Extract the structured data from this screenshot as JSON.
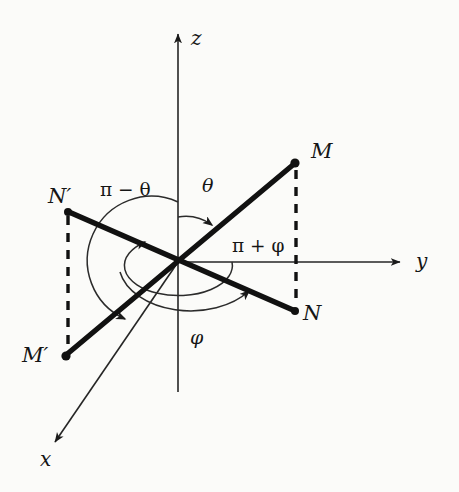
{
  "figure": {
    "kind": "spherical-coordinates-diagram",
    "background_color": "#fbfbf9",
    "ink_color": "#111111",
    "axes": [
      {
        "id": "z",
        "label": "z",
        "label_x": 191,
        "label_y": 45,
        "direction": "up"
      },
      {
        "id": "y",
        "label": "y",
        "label_x": 416,
        "label_y": 268,
        "direction": "right"
      },
      {
        "id": "x",
        "label": "x",
        "label_x": 40,
        "label_y": 466,
        "direction": "down-left"
      }
    ],
    "points": [
      {
        "id": "M",
        "label": "M",
        "dot_x": 295,
        "dot_y": 163,
        "label_x": 311,
        "label_y": 158
      },
      {
        "id": "N",
        "label": "N",
        "dot_x": 295,
        "dot_y": 311,
        "label_x": 303,
        "label_y": 320
      },
      {
        "id": "Nprime",
        "label": "N′",
        "dot_x": 68,
        "dot_y": 212,
        "label_x": 48,
        "label_y": 203
      },
      {
        "id": "Mprime",
        "label": "M′",
        "dot_x": 66,
        "dot_y": 356,
        "label_x": 22,
        "label_y": 362
      }
    ],
    "angles": [
      {
        "id": "theta",
        "label": "θ",
        "label_x": 202,
        "label_y": 192,
        "description": "polar angle from +z to OM"
      },
      {
        "id": "pi-minus-theta",
        "label": "π − θ",
        "label_x": 100,
        "label_y": 196,
        "description": "polar angle from +z to OM′"
      },
      {
        "id": "phi",
        "label": "φ",
        "label_x": 190,
        "label_y": 344,
        "description": "azimuthal angle in xy-plane to ON"
      },
      {
        "id": "pi-plus-phi",
        "label": "π + φ",
        "label_x": 232,
        "label_y": 252,
        "description": "azimuthal angle in xy-plane to ON′"
      }
    ],
    "expr_parts": {
      "pi": "π",
      "minus": "−",
      "plus": "+",
      "theta": "θ",
      "phi": "φ"
    }
  }
}
